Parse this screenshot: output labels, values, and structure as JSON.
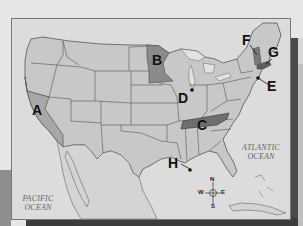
{
  "map": {
    "title": "United States map with lettered locations",
    "colors": {
      "land": "#c8c8c8",
      "water": "#dcdcdc",
      "highlight_medium": "#8a8a8a",
      "highlight_dark": "#6e6e6e",
      "border": "#555555"
    },
    "labels": [
      {
        "id": "A",
        "text": "A",
        "region": "California"
      },
      {
        "id": "B",
        "text": "B",
        "region": "Minnesota"
      },
      {
        "id": "C",
        "text": "C",
        "region": "Tennessee"
      },
      {
        "id": "D",
        "text": "D",
        "region": "Chicago point"
      },
      {
        "id": "E",
        "text": "E",
        "region": "New York City point"
      },
      {
        "id": "F",
        "text": "F",
        "region": "Vermont"
      },
      {
        "id": "G",
        "text": "G",
        "region": "Massachusetts"
      },
      {
        "id": "H",
        "text": "H",
        "region": "New Orleans point"
      }
    ],
    "oceans": {
      "atlantic_line1": "ATLANTIC",
      "atlantic_line2": "OCEAN",
      "pacific_line1": "PACIFIC",
      "pacific_line2": "OCEAN"
    },
    "compass": {
      "n": "N",
      "s": "S",
      "e": "E",
      "w": "W"
    }
  }
}
